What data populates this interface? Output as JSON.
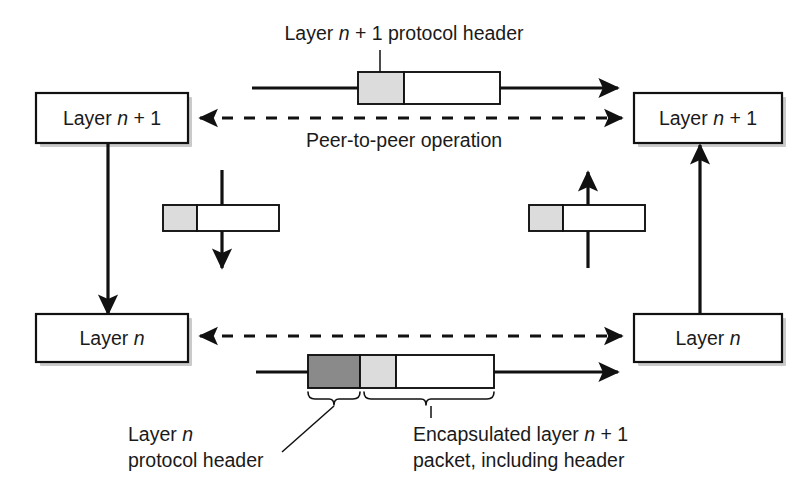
{
  "diagram": {
    "title_caption": "Layer n + 1 protocol header",
    "peer_label": "Peer-to-peer operation",
    "boxes": {
      "top_left": "Layer n + 1",
      "top_right": "Layer n + 1",
      "bottom_left": "Layer n",
      "bottom_right": "Layer n"
    },
    "callouts": {
      "layer_n_header_line1": "Layer n",
      "layer_n_header_line2": "protocol header",
      "encapsulated_line1": "Encapsulated layer n + 1",
      "encapsulated_line2": "packet, including header"
    },
    "segments": {
      "layer_n_header_fill": "#8a8a8a",
      "layer_n1_header_fill": "#dcdcdc",
      "payload_fill": "#ffffff",
      "stroke": "#111111"
    },
    "italic_token": "n",
    "packets": [
      {
        "name": "top-peer-packet",
        "parts": [
          "layer n+1 header",
          "payload"
        ],
        "direction": "right"
      },
      {
        "name": "left-descend-packet",
        "parts": [
          "layer n+1 header",
          "payload"
        ],
        "direction": "down"
      },
      {
        "name": "right-ascend-packet",
        "parts": [
          "layer n+1 header",
          "payload"
        ],
        "direction": "up"
      },
      {
        "name": "bottom-peer-packet",
        "parts": [
          "layer n header",
          "layer n+1 header",
          "payload"
        ],
        "direction": "right"
      }
    ]
  }
}
